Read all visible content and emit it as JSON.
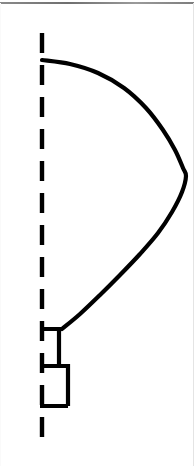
{
  "figure": {
    "canvas": {
      "width": 194,
      "height": 466,
      "background": "#ffffff"
    },
    "ink_color": "#000000",
    "rule_color": "#7a7a7a",
    "edge_color": "#e4e4e4"
  },
  "chart_data": {
    "type": "line",
    "title": "",
    "xlabel": "",
    "ylabel": "",
    "xlim": [
      0,
      194
    ],
    "ylim": [
      466,
      0
    ],
    "grid": false,
    "legend": null,
    "axis_line": {
      "name": "centerline",
      "style": "dashed",
      "orientation": "vertical",
      "x": 42,
      "y_start": 33,
      "y_end": 437,
      "stroke_width": 4,
      "dash_length": 20,
      "gap_length": 12,
      "color": "#000000"
    },
    "series": [
      {
        "name": "lobe-outline",
        "style": "solid",
        "stroke_width": 4.2,
        "color": "#000000",
        "closed": false,
        "points": [
          [
            42,
            60
          ],
          [
            70,
            64
          ],
          [
            98,
            73
          ],
          [
            124,
            88
          ],
          [
            146,
            108
          ],
          [
            163,
            130
          ],
          [
            175,
            150
          ],
          [
            183,
            168
          ],
          [
            186,
            176
          ],
          [
            182,
            192
          ],
          [
            172,
            212
          ],
          [
            158,
            233
          ],
          [
            140,
            254
          ],
          [
            120,
            275
          ],
          [
            100,
            295
          ],
          [
            80,
            314
          ],
          [
            62,
            329
          ]
        ]
      },
      {
        "name": "step-base",
        "style": "solid",
        "stroke_width": 4.2,
        "color": "#000000",
        "closed": false,
        "points": [
          [
            40,
            329
          ],
          [
            59,
            329
          ],
          [
            59,
            366
          ],
          [
            40,
            366
          ],
          [
            40,
            366
          ],
          [
            68,
            366
          ],
          [
            68,
            406
          ],
          [
            40,
            406
          ]
        ],
        "segments": [
          {
            "name": "step-1-top",
            "x1": 40,
            "y1": 329,
            "x2": 59,
            "y2": 329
          },
          {
            "name": "step-1-riser",
            "x1": 59,
            "y1": 329,
            "x2": 59,
            "y2": 366
          },
          {
            "name": "step-2-top",
            "x1": 40,
            "y1": 366,
            "x2": 68,
            "y2": 366
          },
          {
            "name": "step-2-riser",
            "x1": 68,
            "y1": 366,
            "x2": 68,
            "y2": 406
          },
          {
            "name": "step-3-top",
            "x1": 40,
            "y1": 406,
            "x2": 68,
            "y2": 406
          }
        ]
      }
    ],
    "annotations": []
  }
}
